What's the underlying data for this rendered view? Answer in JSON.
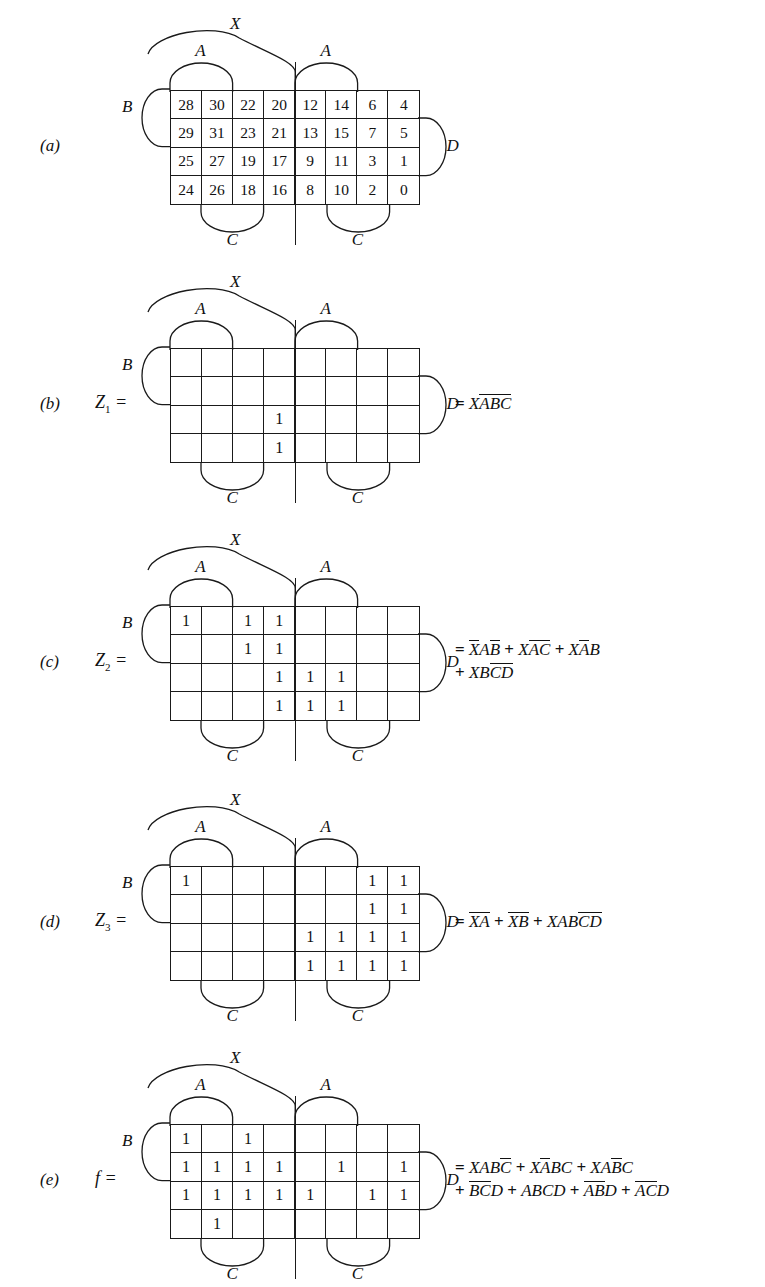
{
  "figure": {
    "type": "karnaugh-map-set"
  },
  "map_geometry": {
    "columns": 8,
    "rows": 4,
    "bracket_labels": {
      "top_span": "X",
      "top_left_group": "A",
      "top_right_group": "A",
      "left": "B",
      "right": "D",
      "bottom_left_group": "C",
      "bottom_right_group": "C"
    }
  },
  "panels": [
    {
      "part": "(a)",
      "lhs": "",
      "lhs_sub": "",
      "cells": [
        [
          "28",
          "30",
          "22",
          "20",
          "12",
          "14",
          "6",
          "4"
        ],
        [
          "29",
          "31",
          "23",
          "21",
          "13",
          "15",
          "7",
          "5"
        ],
        [
          "25",
          "27",
          "19",
          "17",
          "9",
          "11",
          "3",
          "1"
        ],
        [
          "24",
          "26",
          "18",
          "16",
          "8",
          "10",
          "2",
          "0"
        ]
      ],
      "equation": []
    },
    {
      "part": "(b)",
      "lhs": "Z",
      "lhs_sub": "1",
      "lhs_suffix": " =",
      "cells": [
        [
          "",
          "",
          "",
          "",
          "",
          "",
          "",
          ""
        ],
        [
          "",
          "",
          "",
          "",
          "",
          "",
          "",
          ""
        ],
        [
          "",
          "",
          "",
          "1",
          "",
          "",
          "",
          ""
        ],
        [
          "",
          "",
          "",
          "1",
          "",
          "",
          "",
          ""
        ]
      ],
      "equation": [
        [
          {
            "t": "=",
            "ov": false,
            "op": true
          },
          {
            "t": "X",
            "ov": false
          },
          {
            "t": "A",
            "ov": true
          },
          {
            "t": "B",
            "ov": true
          },
          {
            "t": "C",
            "ov": true
          }
        ]
      ]
    },
    {
      "part": "(c)",
      "lhs": "Z",
      "lhs_sub": "2",
      "lhs_suffix": " =",
      "cells": [
        [
          "1",
          "",
          "1",
          "1",
          "",
          "",
          "",
          ""
        ],
        [
          "",
          "",
          "1",
          "1",
          "",
          "",
          "",
          ""
        ],
        [
          "",
          "",
          "",
          "1",
          "1",
          "1",
          "",
          ""
        ],
        [
          "",
          "",
          "",
          "1",
          "1",
          "1",
          "",
          ""
        ]
      ],
      "equation": [
        [
          {
            "t": "=",
            "ov": false,
            "op": true
          },
          {
            "t": "X",
            "ov": true
          },
          {
            "t": "A",
            "ov": false
          },
          {
            "t": "B",
            "ov": true
          },
          {
            "t": "+",
            "ov": false,
            "op": true
          },
          {
            "t": "X",
            "ov": false
          },
          {
            "t": "A",
            "ov": true
          },
          {
            "t": "C",
            "ov": true
          },
          {
            "t": "+",
            "ov": false,
            "op": true
          },
          {
            "t": "X",
            "ov": false
          },
          {
            "t": "A",
            "ov": true
          },
          {
            "t": "B",
            "ov": false
          }
        ],
        [
          {
            "t": "+",
            "ov": false,
            "op": true
          },
          {
            "t": "X",
            "ov": false
          },
          {
            "t": "B",
            "ov": false
          },
          {
            "t": "C",
            "ov": true
          },
          {
            "t": "D",
            "ov": true
          }
        ]
      ]
    },
    {
      "part": "(d)",
      "lhs": "Z",
      "lhs_sub": "3",
      "lhs_suffix": " =",
      "cells": [
        [
          "1",
          "",
          "",
          "",
          "",
          "",
          "1",
          "1"
        ],
        [
          "",
          "",
          "",
          "",
          "",
          "",
          "1",
          "1"
        ],
        [
          "",
          "",
          "",
          "",
          "1",
          "1",
          "1",
          "1"
        ],
        [
          "",
          "",
          "",
          "",
          "1",
          "1",
          "1",
          "1"
        ]
      ],
      "equation": [
        [
          {
            "t": "=",
            "ov": false,
            "op": true
          },
          {
            "t": "X",
            "ov": true
          },
          {
            "t": "A",
            "ov": true
          },
          {
            "t": "+",
            "ov": false,
            "op": true
          },
          {
            "t": "X",
            "ov": true
          },
          {
            "t": "B",
            "ov": true
          },
          {
            "t": "+",
            "ov": false,
            "op": true
          },
          {
            "t": "X",
            "ov": false
          },
          {
            "t": "A",
            "ov": false
          },
          {
            "t": "B",
            "ov": false
          },
          {
            "t": "C",
            "ov": true
          },
          {
            "t": "D",
            "ov": true
          }
        ]
      ]
    },
    {
      "part": "(e)",
      "lhs": "f",
      "lhs_sub": "",
      "lhs_suffix": " =",
      "cells": [
        [
          "1",
          "",
          "1",
          "",
          "",
          "",
          "",
          ""
        ],
        [
          "1",
          "1",
          "1",
          "1",
          "",
          "1",
          "",
          "1"
        ],
        [
          "1",
          "1",
          "1",
          "1",
          "1",
          "",
          "1",
          "1"
        ],
        [
          "",
          "1",
          "",
          "",
          "",
          "",
          "",
          ""
        ]
      ],
      "equation": [
        [
          {
            "t": "=",
            "ov": false,
            "op": true
          },
          {
            "t": "X",
            "ov": false
          },
          {
            "t": "A",
            "ov": false
          },
          {
            "t": "B",
            "ov": false
          },
          {
            "t": "C",
            "ov": true
          },
          {
            "t": "+",
            "ov": false,
            "op": true
          },
          {
            "t": "X",
            "ov": false
          },
          {
            "t": "A",
            "ov": true
          },
          {
            "t": "B",
            "ov": false
          },
          {
            "t": "C",
            "ov": false
          },
          {
            "t": "+",
            "ov": false,
            "op": true
          },
          {
            "t": "X",
            "ov": false
          },
          {
            "t": "A",
            "ov": false
          },
          {
            "t": "B",
            "ov": true
          },
          {
            "t": "C",
            "ov": false
          }
        ],
        [
          {
            "t": "+",
            "ov": false,
            "op": true
          },
          {
            "t": "B",
            "ov": true
          },
          {
            "t": "C",
            "ov": true
          },
          {
            "t": "D",
            "ov": false
          },
          {
            "t": "+",
            "ov": false,
            "op": true
          },
          {
            "t": "A",
            "ov": false
          },
          {
            "t": "B",
            "ov": false
          },
          {
            "t": "C",
            "ov": false
          },
          {
            "t": "D",
            "ov": false
          },
          {
            "t": "+",
            "ov": false,
            "op": true
          },
          {
            "t": "A",
            "ov": true
          },
          {
            "t": "B",
            "ov": true
          },
          {
            "t": "D",
            "ov": false
          },
          {
            "t": "+",
            "ov": false,
            "op": true
          },
          {
            "t": "A",
            "ov": true
          },
          {
            "t": "C",
            "ov": true
          },
          {
            "t": "D",
            "ov": false
          }
        ]
      ]
    }
  ]
}
